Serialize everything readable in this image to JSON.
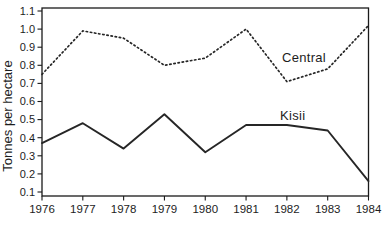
{
  "chart_data": {
    "type": "line",
    "title": "",
    "xlabel": "",
    "ylabel": "Tonnes per hectare",
    "x": [
      1976,
      1977,
      1978,
      1979,
      1980,
      1981,
      1982,
      1983,
      1984
    ],
    "x_tick_labels": [
      "1976",
      "1977",
      "1978",
      "1979",
      "1980",
      "1981",
      "1982",
      "1983",
      "1984"
    ],
    "y_ticks": [
      0.1,
      0.2,
      0.3,
      0.4,
      0.5,
      0.6,
      0.7,
      0.8,
      0.9,
      1.0,
      1.1
    ],
    "y_tick_labels": [
      "0.1",
      "0.2",
      "0.3",
      "0.4",
      "0.5",
      "0.6",
      "0.7",
      "0.8",
      "0.9",
      "1.0",
      "1.1"
    ],
    "ylim": [
      0.1,
      1.1
    ],
    "grid": false,
    "legend_position": "inline-labels",
    "line_color": "#262626",
    "frame_color": "#1a1a1a",
    "background_color": "#ffffff",
    "series": [
      {
        "name": "Central",
        "style": "dotted",
        "values": [
          0.75,
          0.99,
          0.95,
          0.8,
          0.84,
          1.0,
          0.71,
          0.78,
          1.02
        ]
      },
      {
        "name": "Kisii",
        "style": "solid",
        "values": [
          0.37,
          0.48,
          0.34,
          0.53,
          0.32,
          0.47,
          0.47,
          0.44,
          0.16
        ]
      }
    ]
  }
}
